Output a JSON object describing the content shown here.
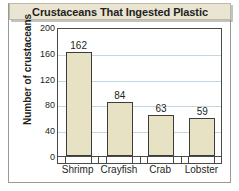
{
  "figure": {
    "title": "Crustaceans That Ingested Plastic",
    "background_color": "#ffffff",
    "title_band_color": "#e9e5d2",
    "bar_fill_color": "#e8e2c4",
    "bar_outline_color": "#3c3c3a",
    "gridline_color": "#c3d6e4",
    "axis_color": "#4a4a48"
  },
  "chart_data": {
    "type": "bar",
    "title": "Crustaceans That Ingested Plastic",
    "xlabel": "",
    "ylabel": "Number of crustaceans",
    "categories": [
      "Shrimp",
      "Crayfish",
      "Crab",
      "Lobster"
    ],
    "values": [
      162,
      84,
      63,
      59
    ],
    "value_labels": [
      "162",
      "84",
      "63",
      "59"
    ],
    "ylim": [
      0,
      200
    ],
    "yticks": [
      0,
      40,
      80,
      120,
      160,
      200
    ],
    "ytick_labels": [
      "0",
      "40",
      "80",
      "120",
      "160",
      "200"
    ],
    "grid": true,
    "grid_axis": "y",
    "legend": false,
    "legend_position": "none"
  }
}
